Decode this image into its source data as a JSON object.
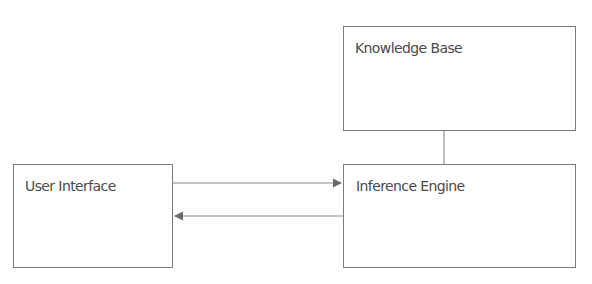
{
  "diagram": {
    "nodes": [
      {
        "id": "knowledge_base",
        "label": "Knowledge Base"
      },
      {
        "id": "user_interface",
        "label": "User Interface"
      },
      {
        "id": "inference_engine",
        "label": "Inference Engine"
      }
    ],
    "edges": [
      {
        "from": "user_interface",
        "to": "inference_engine",
        "type": "arrow"
      },
      {
        "from": "inference_engine",
        "to": "user_interface",
        "type": "arrow"
      },
      {
        "from": "knowledge_base",
        "to": "inference_engine",
        "type": "line"
      }
    ],
    "colors": {
      "border": "#7a7a7a",
      "text": "#4a4a4a",
      "background": "#ffffff"
    }
  }
}
